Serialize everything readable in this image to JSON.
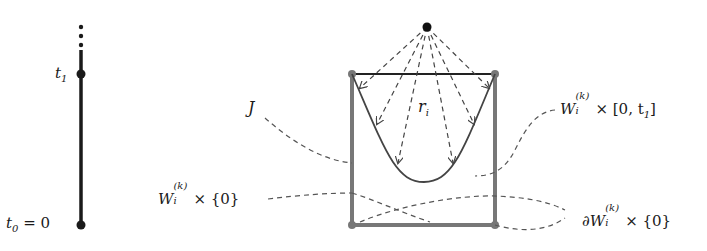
{
  "diagram": {
    "timeline": {
      "labels": {
        "t1": "t",
        "t1_sub": "1",
        "t0": "t",
        "t0_sub": "0",
        "t0_rest": " = 0"
      },
      "continuation_dots": 3
    },
    "labels": {
      "J": "J",
      "r": "r",
      "r_sub": "i",
      "W_top_base": "W",
      "W_top_sup": "(k)",
      "W_top_sub": "i",
      "W_top_rest": "× [0, t",
      "W_top_rest_sub": "1",
      "W_top_close": "]",
      "W_bottom_base": "W",
      "W_bottom_sup": "(k)",
      "W_bottom_sub": "i",
      "W_bottom_rest": "× {0}",
      "dW_prefix": "∂W",
      "dW_sup": "(k)",
      "dW_sub": "i",
      "dW_rest": "× {0}"
    },
    "colors": {
      "timeline": "#1a1a1a",
      "box": "#777777",
      "top_edge": "#222222",
      "curve": "#444444",
      "dashed": "#555555",
      "apex": "#111111"
    }
  }
}
